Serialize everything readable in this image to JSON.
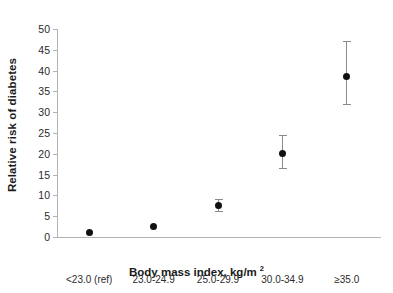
{
  "chart_data": {
    "type": "scatter",
    "title": "",
    "xlabel": "Body mass index, kg/m",
    "xlabel_superscript": "2",
    "ylabel": "Relative risk of diabetes",
    "categories": [
      "<23.0 (ref)",
      "23.0-24.9",
      "25.0-29.9",
      "30.0-34.9",
      "≥35.0"
    ],
    "values": [
      1.0,
      2.6,
      7.5,
      20.1,
      38.7
    ],
    "error_low": [
      null,
      null,
      6.3,
      16.5,
      32.0
    ],
    "error_high": [
      null,
      null,
      9.2,
      24.5,
      47.0
    ],
    "ylim": [
      0,
      50
    ],
    "ytick_step": 5,
    "yticks": [
      0,
      5,
      10,
      15,
      20,
      25,
      30,
      35,
      40,
      45,
      50
    ],
    "ytick_labels": [
      "0",
      "5",
      "10",
      "15",
      "20",
      "25",
      "30",
      "35",
      "40",
      "45",
      "50"
    ],
    "grid": false,
    "legend": false,
    "marker_color": "#111111",
    "error_bar_color": "#8a8a8a",
    "axis_color": "#b3b3b3",
    "background": "#ffffff",
    "points": [
      {
        "category": "<23.0 (ref)",
        "value": 1.0,
        "low": null,
        "high": null
      },
      {
        "category": "23.0-24.9",
        "value": 2.6,
        "low": null,
        "high": null
      },
      {
        "category": "25.0-29.9",
        "value": 7.5,
        "low": 6.3,
        "high": 9.2
      },
      {
        "category": "30.0-34.9",
        "value": 20.1,
        "low": 16.5,
        "high": 24.5
      },
      {
        "category": "≥35.0",
        "value": 38.7,
        "low": 32.0,
        "high": 47.0
      }
    ]
  }
}
